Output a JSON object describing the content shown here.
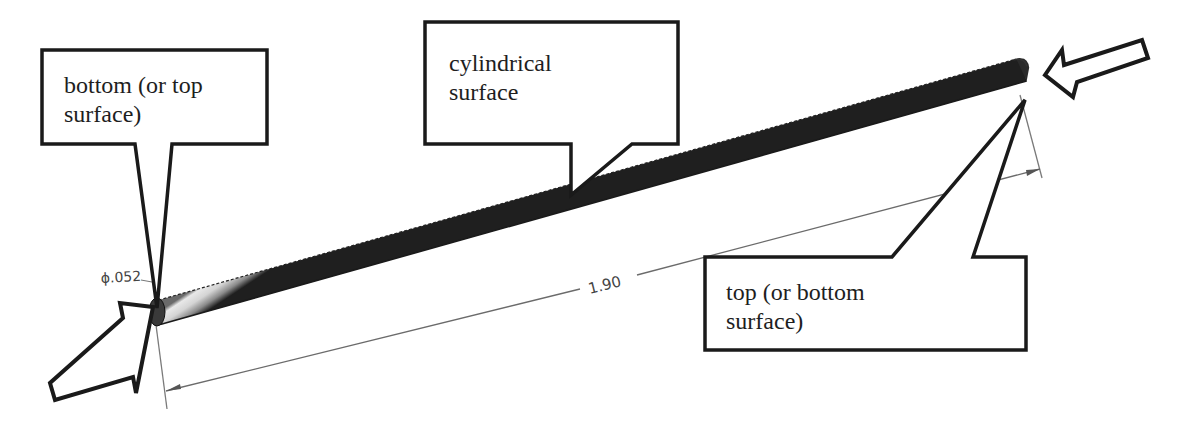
{
  "diagram": {
    "callouts": [
      {
        "id": "bottom",
        "text": "bottom (or top\nsurface)",
        "points_to": "left end face"
      },
      {
        "id": "cylindrical",
        "text": "cylindrical\nsurface",
        "points_to": "rod side surface"
      },
      {
        "id": "top",
        "text": "top (or bottom\nsurface)",
        "points_to": "right end face"
      }
    ],
    "dimensions": {
      "diameter_label": "ϕ.052",
      "length_label": "1.90"
    },
    "arrows": [
      {
        "id": "left-load-arrow",
        "direction": "pointing right toward left end face"
      },
      {
        "id": "right-load-arrow",
        "direction": "pointing left toward right end face"
      }
    ],
    "colors": {
      "outline": "#1a1a1a",
      "dimension_line": "#6b6b6b",
      "rod_light": "#f2f2f2",
      "rod_dark": "#2b2b2b"
    }
  }
}
